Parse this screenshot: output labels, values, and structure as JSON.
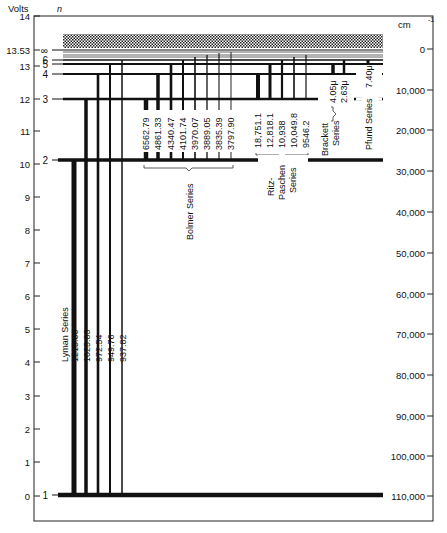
{
  "diagram": {
    "left_axis": {
      "unit_label": "Volts",
      "ticks": [
        {
          "label": "14",
          "y": 16
        },
        {
          "label": "13.53",
          "y": 50
        },
        {
          "label": "13",
          "y": 66
        },
        {
          "label": "12",
          "y": 99
        },
        {
          "label": "11",
          "y": 131
        },
        {
          "label": "10",
          "y": 164
        },
        {
          "label": "9",
          "y": 197
        },
        {
          "label": "8",
          "y": 230
        },
        {
          "label": "7",
          "y": 263
        },
        {
          "label": "6",
          "y": 296
        },
        {
          "label": "5",
          "y": 329
        },
        {
          "label": "4",
          "y": 362
        },
        {
          "label": "3",
          "y": 396
        },
        {
          "label": "2",
          "y": 429
        },
        {
          "label": "1",
          "y": 462
        },
        {
          "label": "0",
          "y": 496
        }
      ]
    },
    "right_axis": {
      "unit_label": "cm",
      "unit_superscript": "-1",
      "ticks": [
        {
          "label": "0",
          "y": 49
        },
        {
          "label": "10,000",
          "y": 90
        },
        {
          "label": "20,000",
          "y": 130
        },
        {
          "label": "30,000",
          "y": 171
        },
        {
          "label": "40,000",
          "y": 212
        },
        {
          "label": "50,000",
          "y": 253
        },
        {
          "label": "60,000",
          "y": 294
        },
        {
          "label": "70,000",
          "y": 334
        },
        {
          "label": "80,000",
          "y": 375
        },
        {
          "label": "90,000",
          "y": 416
        },
        {
          "label": "100,000",
          "y": 456
        },
        {
          "label": "110,000",
          "y": 496
        }
      ]
    },
    "n_label": "n",
    "levels": [
      {
        "n": "∞",
        "y": 50
      },
      {
        "n": "6",
        "y": 60
      },
      {
        "n": "5",
        "y": 64
      },
      {
        "n": "4",
        "y": 74
      },
      {
        "n": "3",
        "y": 99
      },
      {
        "n": "2",
        "y": 160
      },
      {
        "n": "1",
        "y": 495
      }
    ],
    "series": [
      {
        "name": "Lyman Series",
        "lines": [
          "1215.66",
          "1025.83",
          "972.54",
          "949.76",
          "937.82"
        ]
      },
      {
        "name": "Bolmer Series",
        "lines": [
          "6562.79",
          "4861.33",
          "4340.47",
          "4101.74",
          "3970.07",
          "3889.05",
          "3835.39",
          "3797.90"
        ]
      },
      {
        "name_lines": [
          "Ritz-",
          "Paschen",
          "Series"
        ],
        "lines": [
          "18,751.1",
          "12,818.1",
          "10,938",
          "10,049.8",
          "9546.2"
        ]
      },
      {
        "name_lines": [
          "Brackett",
          "Series"
        ],
        "lines": [
          "4.05μ",
          "2.63μ"
        ]
      },
      {
        "name": "Pfund Series",
        "lines": [
          "7.40μ"
        ]
      }
    ]
  }
}
